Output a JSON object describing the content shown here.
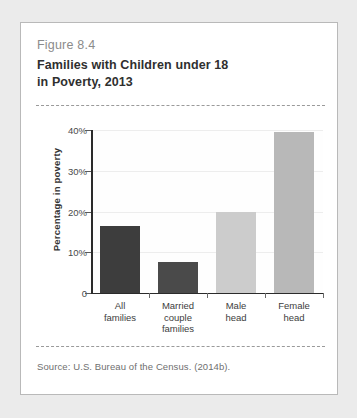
{
  "figure": {
    "number_label": "Figure 8.4",
    "title_line1": "Families with Children under 18",
    "title_line2": "in Poverty, 2013",
    "source": "Source: U.S. Bureau of the Census. (2014b)."
  },
  "colors": {
    "page_background": "#ebebeb",
    "card_background": "#ffffff",
    "card_border": "#b9b9b9",
    "bar_dark": "#3d3d3d",
    "bar_dark2": "#4a4a4a",
    "bar_light": "#cccccc",
    "bar_medium": "#b8b8b8",
    "axis": "#2b2b2b",
    "gridline": "#ededed"
  },
  "chart_data": {
    "type": "bar",
    "title": "Families with Children under 18 in Poverty, 2013",
    "xlabel": "",
    "ylabel": "Percentage in poverty",
    "categories": [
      "All families",
      "Married couple families",
      "Male head",
      "Female head"
    ],
    "category_label_lines": [
      [
        "All",
        "families"
      ],
      [
        "Married",
        "couple",
        "families"
      ],
      [
        "Male",
        "head"
      ],
      [
        "Female",
        "head"
      ]
    ],
    "values": [
      16.5,
      7.5,
      19.8,
      39.6
    ],
    "value_unit": "percent",
    "ylim": [
      0,
      40
    ],
    "yticks": [
      0,
      10,
      20,
      30,
      40
    ],
    "ytick_labels": [
      "0",
      "10%",
      "20%",
      "30%",
      "40%"
    ],
    "grid": true,
    "legend": false,
    "bar_colors": [
      "#3d3d3d",
      "#4a4a4a",
      "#cccccc",
      "#b8b8b8"
    ],
    "source": "Source: U.S. Bureau of the Census. (2014b)."
  }
}
